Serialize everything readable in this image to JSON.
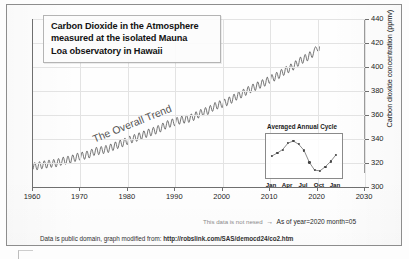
{
  "title": {
    "lines": [
      "Carbon Dioxide in the Atmosphere",
      "measured at the isolated Mauna",
      "Loa observatory in Hawaii"
    ]
  },
  "annotations": {
    "trend": "The Overall Trend",
    "status_note_faint": "This data is not nesed",
    "status_arrow": "→",
    "status_value": "As of year=2020 month=05",
    "source_prefix": "Data is public domain, graph modified from:",
    "source_url": "http://robslink.com/SAS/democd24/co2.htm"
  },
  "chart_data": {
    "type": "line",
    "title": "Carbon Dioxide in the Atmosphere measured at the isolated Mauna Loa observatory in Hawaii",
    "xlabel": "",
    "ylabel": "Carbon dioxide concentration (ppmv)",
    "xlim": [
      1960,
      2030
    ],
    "ylim": [
      300,
      440
    ],
    "xticks": [
      1960,
      1970,
      1980,
      1990,
      2000,
      2010,
      2020,
      2030
    ],
    "yticks": [
      300,
      320,
      340,
      360,
      380,
      400,
      420,
      440
    ],
    "grid": true,
    "legend": "none",
    "series": [
      {
        "name": "Monthly mean CO2 (with seasonal cycle)",
        "x": [
          1960,
          1961,
          1962,
          1963,
          1964,
          1965,
          1966,
          1967,
          1968,
          1969,
          1970,
          1971,
          1972,
          1973,
          1974,
          1975,
          1976,
          1977,
          1978,
          1979,
          1980,
          1981,
          1982,
          1983,
          1984,
          1985,
          1986,
          1987,
          1988,
          1989,
          1990,
          1991,
          1992,
          1993,
          1994,
          1995,
          1996,
          1997,
          1998,
          1999,
          2000,
          2001,
          2002,
          2003,
          2004,
          2005,
          2006,
          2007,
          2008,
          2009,
          2010,
          2011,
          2012,
          2013,
          2014,
          2015,
          2016,
          2017,
          2018,
          2019,
          2020.4
        ],
        "values": [
          316.9,
          317.6,
          318.5,
          319.0,
          319.6,
          320.0,
          321.4,
          322.2,
          323.0,
          324.6,
          325.7,
          326.3,
          327.5,
          329.7,
          330.2,
          331.1,
          332.0,
          333.8,
          335.4,
          336.8,
          338.7,
          340.1,
          341.4,
          343.0,
          344.6,
          346.0,
          347.4,
          349.2,
          351.6,
          353.1,
          354.4,
          355.6,
          356.4,
          357.1,
          358.8,
          360.8,
          362.6,
          363.7,
          366.6,
          368.3,
          369.5,
          371.1,
          373.2,
          375.8,
          377.5,
          379.8,
          381.9,
          383.8,
          385.6,
          387.4,
          389.9,
          391.6,
          393.8,
          396.5,
          398.6,
          400.8,
          404.2,
          406.5,
          408.5,
          411.4,
          417.1
        ],
        "seasonal_amplitude_ppm": 6.4,
        "seasonal_peak_month": "May",
        "seasonal_min_month": "September"
      }
    ]
  },
  "inset_chart_data": {
    "type": "line",
    "title": "Averaged Annual Cycle",
    "xlabel": "",
    "ylabel": "",
    "xticks": [
      "Jan",
      "Apr",
      "Jul",
      "Oct",
      "Jan"
    ],
    "categories": [
      "Jan",
      "Feb",
      "Mar",
      "Apr",
      "May",
      "Jun",
      "Jul",
      "Aug",
      "Sep",
      "Oct",
      "Nov",
      "Dec",
      "Jan"
    ],
    "values": [
      335.2,
      336.2,
      337.4,
      339.6,
      340.3,
      339.2,
      337.1,
      333.0,
      330.3,
      330.1,
      331.5,
      333.3,
      335.6
    ],
    "ylim": [
      329,
      341
    ],
    "grid": false,
    "legend": "none"
  },
  "axes": {
    "y_title": "Carbon dioxide concentration (ppmv)",
    "y_ticks": [
      "300",
      "320",
      "340",
      "360",
      "380",
      "400",
      "420",
      "440"
    ],
    "x_ticks": [
      "1960",
      "1970",
      "1980",
      "1990",
      "2000",
      "2010",
      "2020",
      "2030"
    ]
  },
  "inset_axis": {
    "x_ticks": [
      "Jan",
      "Apr",
      "Jul",
      "Oct",
      "Jan"
    ]
  },
  "colors": {
    "line": "#4a4a4a",
    "grid": "#e3e3e3",
    "axis": "#6f6f6f",
    "text": "#141414",
    "frame": "#8d8d8d"
  }
}
